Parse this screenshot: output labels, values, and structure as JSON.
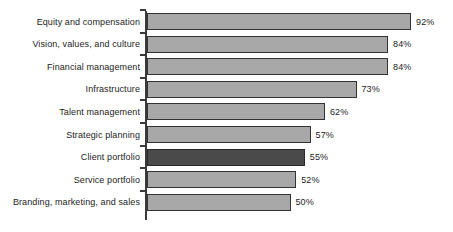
{
  "chart_data": {
    "type": "bar",
    "orientation": "horizontal",
    "title": "",
    "subtitle": "",
    "xlabel": "",
    "ylabel": "",
    "xlim": [
      0,
      100
    ],
    "grid": false,
    "legend": null,
    "value_suffix": "%",
    "categories": [
      "Equity and compensation",
      "Vision, values, and culture",
      "Financial management",
      "Infrastructure",
      "Talent management",
      "Strategic planning",
      "Client portfolio",
      "Service portfolio",
      "Branding, marketing, and sales"
    ],
    "values": [
      92,
      84,
      84,
      73,
      62,
      57,
      55,
      52,
      50
    ],
    "value_labels": [
      "92%",
      "84%",
      "84%",
      "73%",
      "62%",
      "57%",
      "55%",
      "52%",
      "50%"
    ],
    "highlighted_index": 6,
    "colors": {
      "bar_fill": "#a8a8a8",
      "bar_border": "#333333",
      "bar_fill_highlight": "#4a4a4a",
      "bar_border_highlight": "#2a2a2a",
      "axis": "#3a3a3a",
      "text": "#1c1c1c",
      "background": "#ffffff"
    }
  }
}
